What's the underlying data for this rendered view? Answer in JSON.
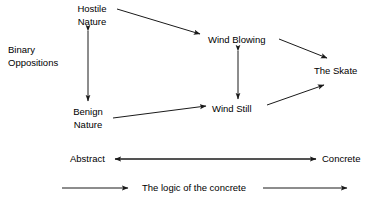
{
  "diagram": {
    "title_label": "Binary Oppositions",
    "nodes": [
      {
        "id": "hostile-nature",
        "label": "Hostile\nNature"
      },
      {
        "id": "benign-nature",
        "label": "Benign\nNature"
      },
      {
        "id": "wind-blowing",
        "label": "Wind Blowing"
      },
      {
        "id": "wind-still",
        "label": "Wind Still"
      },
      {
        "id": "the-skate",
        "label": "The Skate"
      },
      {
        "id": "abstract",
        "label": "Abstract"
      },
      {
        "id": "concrete",
        "label": "Concrete"
      },
      {
        "id": "logic-concrete",
        "label": "The logic of the concrete"
      }
    ],
    "node_labels": {
      "hostile_nature_line1": "Hostile",
      "hostile_nature_line2": "Nature",
      "benign_nature_line1": "Benign",
      "benign_nature_line2": "Nature",
      "wind_blowing": "Wind Blowing",
      "wind_still": "Wind Still",
      "the_skate": "The Skate",
      "abstract": "Abstract",
      "concrete": "Concrete",
      "logic_of_the_concrete": "The logic of the concrete"
    },
    "edges": [
      {
        "id": "hostile-to-benign",
        "from": "hostile-nature",
        "to": "benign-nature",
        "heads": "both"
      },
      {
        "id": "hostile-to-windblowing",
        "from": "hostile-nature",
        "to": "wind-blowing",
        "heads": "end"
      },
      {
        "id": "windblowing-to-skate",
        "from": "wind-blowing",
        "to": "the-skate",
        "heads": "end"
      },
      {
        "id": "windblowing-to-windstill",
        "from": "wind-blowing",
        "to": "wind-still",
        "heads": "both"
      },
      {
        "id": "benign-to-windstill",
        "from": "benign-nature",
        "to": "wind-still",
        "heads": "end"
      },
      {
        "id": "windstill-to-skate",
        "from": "wind-still",
        "to": "the-skate",
        "heads": "end"
      },
      {
        "id": "concrete-to-abstract",
        "from": "concrete",
        "to": "abstract",
        "heads": "end"
      },
      {
        "id": "abstract-to-concrete",
        "from": "abstract",
        "to": "concrete",
        "heads": "end"
      },
      {
        "id": "logic-arrow-left",
        "from": "",
        "to": "logic-concrete",
        "heads": "end"
      },
      {
        "id": "logic-arrow-right",
        "from": "logic-concrete",
        "to": "",
        "heads": "end"
      }
    ],
    "colors": {
      "line": "#1a1a1a",
      "text": "#000000",
      "background": "#ffffff"
    }
  }
}
